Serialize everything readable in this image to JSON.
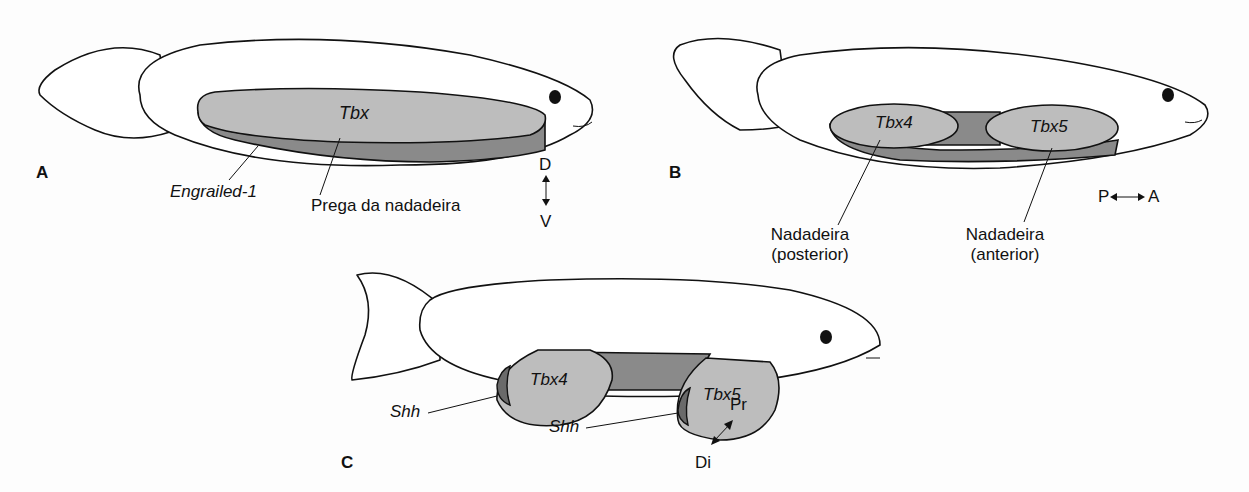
{
  "panels": {
    "A": {
      "letter": "A",
      "gene_label": "Tbx",
      "labels": {
        "engrailed": "Engrailed-1",
        "fin_fold": "Prega da nadadeira"
      },
      "axis": {
        "top": "D",
        "bottom": "V"
      }
    },
    "B": {
      "letter": "B",
      "gene_labels": {
        "posterior": "Tbx4",
        "anterior": "Tbx5"
      },
      "labels": {
        "posterior_line1": "Nadadeira",
        "posterior_line2": "(posterior)",
        "anterior_line1": "Nadadeira",
        "anterior_line2": "(anterior)"
      },
      "axis": {
        "left": "P",
        "right": "A"
      }
    },
    "C": {
      "letter": "C",
      "gene_labels": {
        "posterior": "Tbx4",
        "anterior": "Tbx5"
      },
      "labels": {
        "shh_posterior": "Shh",
        "shh_anterior": "Shh"
      },
      "axis": {
        "top": "Pr",
        "bottom": "Di"
      }
    }
  },
  "colors": {
    "light_fill": "#bdbdbd",
    "dark_fill": "#8a8a8a",
    "darker_fill": "#6a6a6a",
    "outline": "#111111"
  }
}
